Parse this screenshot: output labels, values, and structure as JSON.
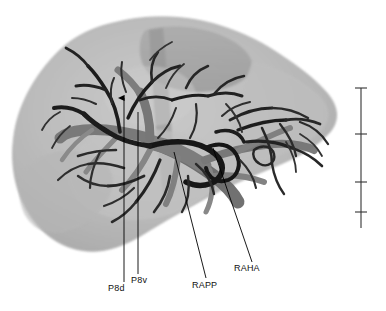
{
  "figure": {
    "kind": "medical-3d-rendering",
    "background_color": "#ffffff",
    "organ_color": "#b4b4b4",
    "organ_edge_color": "#8e8e8e",
    "vessel_light_color": "#8a8a8a",
    "vessel_mid_color": "#5e5e5e",
    "vessel_dark_color": "#1c1c1c",
    "leader_line_color": "#000000",
    "label_color": "#111111"
  },
  "annotations": [
    {
      "id": "p8d",
      "label": "P8d",
      "label_x": 108,
      "label_y": 291,
      "line_x1": 124,
      "line_y1": 282,
      "line_x2": 124,
      "line_y2": 96,
      "arrow": true
    },
    {
      "id": "p8v",
      "label": "P8v",
      "label_x": 131,
      "label_y": 283,
      "line_x1": 138,
      "line_y1": 274,
      "line_x2": 138,
      "line_y2": 112,
      "arrow": false
    },
    {
      "id": "rapp",
      "label": "RAPP",
      "label_x": 192,
      "label_y": 288,
      "line_x1": 206,
      "line_y1": 278,
      "line_x2": 174,
      "line_y2": 152,
      "arrow": false
    },
    {
      "id": "raha",
      "label": "RAHA",
      "label_x": 234,
      "label_y": 271,
      "line_x1": 252,
      "line_y1": 262,
      "line_x2": 213,
      "line_y2": 148,
      "arrow": false
    }
  ],
  "scale_bar": {
    "x": 361,
    "top_y": 88,
    "bottom_y": 228,
    "tick_half_width": 6,
    "color": "#333333",
    "ticks_y": [
      88,
      134,
      182,
      212
    ],
    "tick_count": 4,
    "orientation": "vertical",
    "caption": ""
  }
}
